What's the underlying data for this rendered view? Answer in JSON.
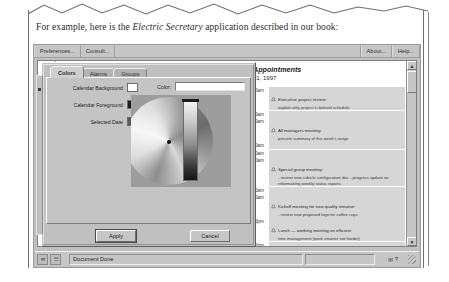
{
  "page": {
    "caption_before": "For example, here is the ",
    "caption_italic": "Electric Secretary",
    "caption_after": " application described in our book:"
  },
  "window": {
    "menubar": {
      "left_items": [
        {
          "label": "Preferences...",
          "name": "menu-preferences"
        },
        {
          "label": "Consult...",
          "name": "menu-consult"
        }
      ],
      "right_items": [
        {
          "label": "About...",
          "name": "menu-about"
        },
        {
          "label": "Help...",
          "name": "menu-help"
        }
      ]
    },
    "statusbar": {
      "message": "Document Done",
      "left_icons": [
        "mail-icon",
        "signal-icon"
      ],
      "right_icons": [
        "envelope-icon",
        "question-icon"
      ],
      "resize_grip": "resize-grip-icon"
    }
  },
  "document": {
    "calendar_strip": {
      "cells": [
        "",
        "2",
        "9",
        "16",
        "23"
      ]
    },
    "appointments": {
      "title": "Appointments",
      "date": "21, 1997",
      "rows": [
        {
          "time": "9:00am",
          "icon": "alarm-bell-icon",
          "text": "Executive project review:",
          "sub": "explain why project is behind schedule"
        },
        {
          "time": "9:30am",
          "icon": "alarm-bell-icon",
          "text": "",
          "sub": ""
        },
        {
          "time": "9:00am",
          "icon": "alarm-bell-icon",
          "text": "All managers meeting:",
          "sub": "present summary of this week's range"
        },
        {
          "time": "9:30am",
          "icon": "alarm-bell-icon",
          "text": "",
          "sub": ""
        },
        {
          "time": "10:00am",
          "icon": "alarm-bell-icon",
          "text": "",
          "sub": ""
        },
        {
          "time": "10:30am",
          "icon": "alarm-bell-icon",
          "text": "Special group meeting:",
          "sub": "- review new cubicle configuration doc - progress update on reformatting weekly status reports"
        },
        {
          "time": "11:00am",
          "icon": "alarm-bell-icon",
          "text": "",
          "sub": ""
        },
        {
          "time": "11:30am",
          "icon": "alarm-bell-icon",
          "text": "Kickoff meeting for new quality initiative",
          "sub": "- review new proposed logo for coffee cups"
        },
        {
          "time": "12:00pm",
          "icon": "alarm-bell-icon",
          "text": "Lunch — working meeting on efficient",
          "sub": "time management (work smarter not harder)"
        },
        {
          "time": "12:30pm",
          "icon": "alarm-bell-icon",
          "text": "",
          "sub": ""
        }
      ]
    },
    "scrollbar": {
      "up": "▲",
      "down": "▼"
    }
  },
  "dialog": {
    "tabs": [
      {
        "label": "Colors",
        "name": "tab-colors",
        "active": true
      },
      {
        "label": "Alarms",
        "name": "tab-alarms",
        "active": false
      },
      {
        "label": "Groups",
        "name": "tab-groups",
        "active": false
      }
    ],
    "fields": [
      {
        "label": "Calendar Background",
        "swatch": "#ffffff"
      },
      {
        "label": "Calendar Foreground",
        "swatch": "#1b1b1b"
      },
      {
        "label": "Selected Date",
        "swatch": "#5a5a5a"
      }
    ],
    "color_label": "Color:",
    "color_value": "",
    "buttons": {
      "apply": "Apply",
      "cancel": "Cancel"
    }
  }
}
